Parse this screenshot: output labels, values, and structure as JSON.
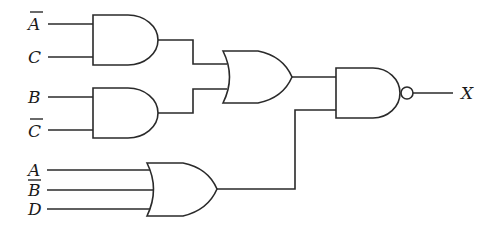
{
  "diagram": {
    "type": "logic-circuit",
    "inputs": [
      {
        "id": "in1",
        "label": "A",
        "negated": true,
        "gate": "and1"
      },
      {
        "id": "in2",
        "label": "C",
        "negated": false,
        "gate": "and1"
      },
      {
        "id": "in3",
        "label": "B",
        "negated": false,
        "gate": "and2"
      },
      {
        "id": "in4",
        "label": "C",
        "negated": true,
        "gate": "and2"
      },
      {
        "id": "in5",
        "label": "A",
        "negated": false,
        "gate": "or2"
      },
      {
        "id": "in6",
        "label": "B",
        "negated": true,
        "gate": "or2"
      },
      {
        "id": "in7",
        "label": "D",
        "negated": false,
        "gate": "or2"
      }
    ],
    "gates": [
      {
        "id": "and1",
        "type": "AND",
        "inputs": [
          "A'",
          "C"
        ]
      },
      {
        "id": "and2",
        "type": "AND",
        "inputs": [
          "B",
          "C'"
        ]
      },
      {
        "id": "or1",
        "type": "OR",
        "inputs": [
          "and1",
          "and2"
        ]
      },
      {
        "id": "or2",
        "type": "OR",
        "inputs": [
          "A",
          "B'",
          "D"
        ]
      },
      {
        "id": "nand1",
        "type": "NAND",
        "inputs": [
          "or1",
          "or2"
        ]
      }
    ],
    "output": {
      "label": "X",
      "from": "nand1"
    },
    "colors": {
      "stroke": "#2a2a2a",
      "background": "#ffffff"
    }
  }
}
